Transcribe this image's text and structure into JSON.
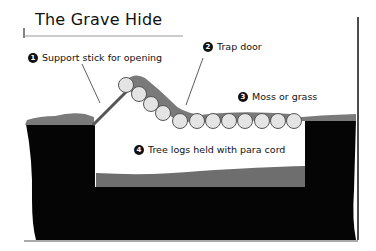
{
  "diagram": {
    "title": "The Grave Hide",
    "labels": [
      {
        "number": "1",
        "text": "Support stick for opening"
      },
      {
        "number": "2",
        "text": "Trap door"
      },
      {
        "number": "3",
        "text": "Moss or grass"
      },
      {
        "number": "4",
        "text": "Tree logs held with para cord"
      }
    ],
    "colors": {
      "ground": "#050505",
      "moss": "#7a7a7a",
      "pit_floor": "#6e6e6e",
      "log_fill": "#e4e4e4",
      "log_outline": "#555555",
      "text": "#111111"
    }
  }
}
